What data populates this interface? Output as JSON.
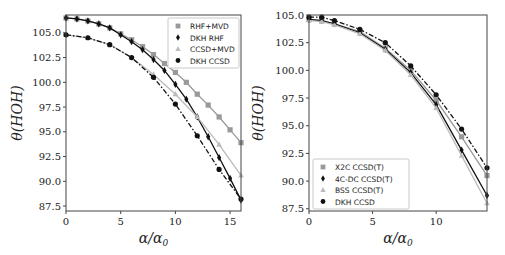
{
  "chart_data": [
    {
      "type": "line",
      "title": "",
      "xlabel": "α/α0",
      "ylabel": "θ(HOH)",
      "xlim": [
        0,
        16
      ],
      "ylim": [
        87.0,
        106.8
      ],
      "xticks": [
        "0",
        "5",
        "10",
        "15"
      ],
      "yticks": [
        "87.5",
        "90.0",
        "92.5",
        "95.0",
        "97.5",
        "100.0",
        "102.5",
        "105.0"
      ],
      "grid": false,
      "legend_position": "upper right",
      "series": [
        {
          "name": "RHF+MVD",
          "marker": "square",
          "color": "#999999",
          "linestyle": "solid",
          "x": [
            0,
            1,
            2,
            3,
            4,
            5,
            6,
            7,
            8,
            9,
            10,
            11,
            12,
            13,
            14,
            15,
            16
          ],
          "y": [
            106.5,
            106.4,
            106.2,
            105.9,
            105.5,
            104.9,
            104.3,
            103.6,
            102.8,
            101.9,
            101.0,
            100.0,
            98.8,
            97.7,
            96.5,
            95.2,
            93.9
          ]
        },
        {
          "name": "DKH RHF",
          "marker": "diamond",
          "color": "#111111",
          "linestyle": "solid",
          "x": [
            0,
            1,
            2,
            3,
            4,
            5,
            6,
            7,
            8,
            9,
            10,
            11,
            12,
            13,
            14,
            15,
            16
          ],
          "y": [
            106.5,
            106.4,
            106.2,
            105.9,
            105.5,
            104.8,
            104.1,
            103.3,
            102.3,
            101.2,
            99.8,
            98.3,
            96.5,
            94.5,
            92.4,
            90.3,
            88.1
          ]
        },
        {
          "name": "CCSD+MVD",
          "marker": "triangle",
          "color": "#bbbbbb",
          "linestyle": "solid",
          "x": [
            0,
            2,
            4,
            6,
            8,
            10,
            12,
            14,
            16
          ],
          "y": [
            104.8,
            104.5,
            103.8,
            102.5,
            100.8,
            98.8,
            96.5,
            93.7,
            90.6
          ]
        },
        {
          "name": "DKH CCSD",
          "marker": "circle",
          "color": "#111111",
          "linestyle": "dashdot",
          "x": [
            0,
            2,
            4,
            6,
            8,
            10,
            12,
            14,
            16
          ],
          "y": [
            104.8,
            104.5,
            103.8,
            102.5,
            100.5,
            97.8,
            94.6,
            91.2,
            88.2
          ]
        }
      ]
    },
    {
      "type": "line",
      "title": "",
      "xlabel": "α/α0",
      "ylabel": "θ(HOH)",
      "xlim": [
        0,
        14
      ],
      "ylim": [
        87.3,
        105.0
      ],
      "xticks": [
        "0",
        "5",
        "10"
      ],
      "yticks": [
        "87.5",
        "90.0",
        "92.5",
        "95.0",
        "97.5",
        "100.0",
        "102.5",
        "105.0"
      ],
      "grid": false,
      "legend_position": "lower left",
      "series": [
        {
          "name": "X2C CCSD(T)",
          "marker": "square",
          "color": "#999999",
          "linestyle": "solid",
          "x": [
            0,
            1,
            2,
            4,
            6,
            8,
            10,
            12,
            14
          ],
          "y": [
            104.6,
            104.5,
            104.2,
            103.5,
            102.0,
            100.0,
            97.3,
            94.0,
            90.5
          ]
        },
        {
          "name": "4C-DC CCSD(T)",
          "marker": "diamond",
          "color": "#111111",
          "linestyle": "solid",
          "x": [
            0,
            1,
            2,
            4,
            6,
            8,
            10,
            12,
            14
          ],
          "y": [
            104.6,
            104.5,
            104.2,
            103.4,
            101.9,
            99.8,
            96.9,
            92.8,
            88.7
          ]
        },
        {
          "name": "BSS CCSD(T)",
          "marker": "triangle",
          "color": "#bbbbbb",
          "linestyle": "solid",
          "x": [
            0,
            1,
            2,
            4,
            6,
            8,
            10,
            12,
            14
          ],
          "y": [
            104.5,
            104.4,
            104.1,
            103.3,
            101.8,
            99.6,
            96.6,
            92.3,
            88.0
          ]
        },
        {
          "name": "DKH CCSD",
          "marker": "circle",
          "color": "#111111",
          "linestyle": "dashdot",
          "x": [
            0,
            1,
            2,
            4,
            6,
            8,
            10,
            12,
            14
          ],
          "y": [
            104.8,
            104.8,
            104.5,
            103.7,
            102.5,
            100.4,
            97.8,
            94.7,
            91.2
          ]
        }
      ]
    }
  ],
  "panels": [
    {
      "xlabel_main": "α/α",
      "xlabel_sub": "0",
      "ylabel": "θ(HOH)"
    },
    {
      "xlabel_main": "α/α",
      "xlabel_sub": "0",
      "ylabel": "θ(HOH)"
    }
  ]
}
